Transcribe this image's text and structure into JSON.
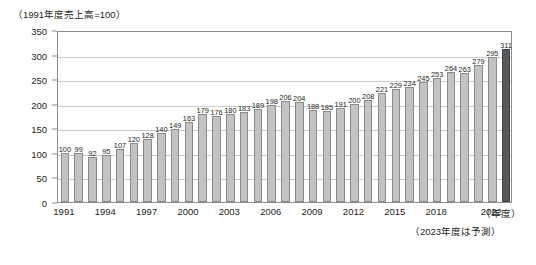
{
  "chart_data": {
    "type": "bar",
    "title": "（1991年度売上高=100）",
    "xlabel": "（年度）",
    "ylabel": "",
    "ylim": [
      0,
      350
    ],
    "ystep": 50,
    "grid": true,
    "legend": "none",
    "note": "（2023年度は予測）",
    "yticks": [
      "0",
      "50",
      "100",
      "150",
      "200",
      "250",
      "300",
      "350"
    ],
    "categories": [
      "1991",
      "1992",
      "1993",
      "1994",
      "1995",
      "1996",
      "1997",
      "1998",
      "1999",
      "2000",
      "2001",
      "2002",
      "2003",
      "2004",
      "2005",
      "2006",
      "2007",
      "2008",
      "2009",
      "2010",
      "2011",
      "2012",
      "2013",
      "2014",
      "2015",
      "2016",
      "2017",
      "2018",
      "2019",
      "2020",
      "2021",
      "2022",
      "2023"
    ],
    "values": [
      100,
      99,
      92,
      95,
      107,
      120,
      128,
      140,
      149,
      163,
      179,
      176,
      180,
      183,
      189,
      198,
      206,
      204,
      188,
      185,
      191,
      200,
      208,
      221,
      229,
      234,
      245,
      253,
      264,
      263,
      279,
      295,
      311
    ],
    "xtick_labels": [
      "1991",
      "1994",
      "1997",
      "2000",
      "2003",
      "2006",
      "2009",
      "2012",
      "2015",
      "2018",
      "2022"
    ],
    "xtick_indices": [
      0,
      3,
      6,
      9,
      12,
      15,
      18,
      21,
      24,
      27,
      31
    ],
    "forecast_index": 32,
    "colors": {
      "bar": "#c3c3c3",
      "bar_border": "#8a8a8a",
      "forecast_bar": "#55585a",
      "forecast_border": "#3f4244",
      "grid": "#c9c9c9",
      "frame": "#8c8c8c",
      "text": "#231f20"
    }
  }
}
